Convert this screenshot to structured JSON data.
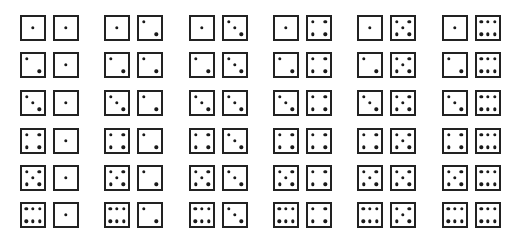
{
  "figure": {
    "title": ""
  },
  "style": {
    "die_border_color": "#222222",
    "pip_color": "#1a1a1a",
    "background": "#ffffff"
  },
  "layout": {
    "column_x": [
      20,
      104,
      189,
      273,
      357,
      442
    ],
    "row_y": [
      15,
      52,
      90,
      128,
      165,
      202
    ],
    "die_size": 26,
    "pair_gap": 7
  },
  "grid": {
    "rows": [
      {
        "first_die": 1,
        "pairs": [
          [
            1,
            1
          ],
          [
            1,
            2
          ],
          [
            1,
            3
          ],
          [
            1,
            4
          ],
          [
            1,
            5
          ],
          [
            1,
            6
          ]
        ]
      },
      {
        "first_die": 2,
        "pairs": [
          [
            2,
            1
          ],
          [
            2,
            2
          ],
          [
            2,
            3
          ],
          [
            2,
            4
          ],
          [
            2,
            5
          ],
          [
            2,
            6
          ]
        ]
      },
      {
        "first_die": 3,
        "pairs": [
          [
            3,
            1
          ],
          [
            3,
            2
          ],
          [
            3,
            3
          ],
          [
            3,
            4
          ],
          [
            3,
            5
          ],
          [
            3,
            6
          ]
        ]
      },
      {
        "first_die": 4,
        "pairs": [
          [
            4,
            1
          ],
          [
            4,
            2
          ],
          [
            4,
            3
          ],
          [
            4,
            4
          ],
          [
            4,
            5
          ],
          [
            4,
            6
          ]
        ]
      },
      {
        "first_die": 5,
        "pairs": [
          [
            5,
            1
          ],
          [
            5,
            2
          ],
          [
            5,
            3
          ],
          [
            5,
            4
          ],
          [
            5,
            5
          ],
          [
            5,
            6
          ]
        ]
      },
      {
        "first_die": 6,
        "pairs": [
          [
            6,
            1
          ],
          [
            6,
            2
          ],
          [
            6,
            3
          ],
          [
            6,
            4
          ],
          [
            6,
            5
          ],
          [
            6,
            6
          ]
        ]
      }
    ]
  },
  "pip_layouts": {
    "1": [
      [
        50,
        50
      ]
    ],
    "2": [
      [
        22,
        22
      ],
      [
        78,
        78
      ]
    ],
    "3": [
      [
        22,
        22
      ],
      [
        50,
        50
      ],
      [
        78,
        78
      ]
    ],
    "4": [
      [
        22,
        22
      ],
      [
        78,
        22
      ],
      [
        22,
        78
      ],
      [
        78,
        78
      ]
    ],
    "5": [
      [
        22,
        22
      ],
      [
        78,
        22
      ],
      [
        50,
        50
      ],
      [
        22,
        78
      ],
      [
        78,
        78
      ]
    ],
    "6": [
      [
        20,
        22
      ],
      [
        50,
        22
      ],
      [
        80,
        22
      ],
      [
        20,
        78
      ],
      [
        50,
        78
      ],
      [
        80,
        78
      ]
    ]
  }
}
